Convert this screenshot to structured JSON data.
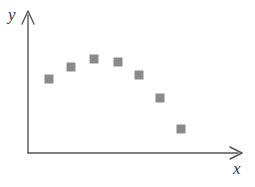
{
  "figure": {
    "background_color": "#ffffff",
    "axis_color": "#555555",
    "marker_color": "#8a8a8a"
  },
  "axes": {
    "x_label": "x",
    "y_label": "y",
    "x_axis_name": "x-axis",
    "y_axis_name": "y-axis",
    "origin": {
      "x": 28,
      "y": 153
    },
    "x_axis_tip": {
      "x": 241,
      "y": 153
    },
    "y_axis_tip": {
      "x": 28,
      "y": 11
    }
  },
  "chart_data": {
    "type": "scatter",
    "title": "",
    "xlabel": "x",
    "ylabel": "y",
    "grid": false,
    "legend": null,
    "marker": "square",
    "marker_color": "#8a8a8a",
    "marker_size_px": 9,
    "xlim": [
      0,
      10
    ],
    "ylim": [
      0,
      10
    ],
    "axis_ticks": false,
    "tick_labels": {
      "x": [],
      "y": []
    },
    "points": [
      {
        "x": 1,
        "y": 5.5,
        "px": 49,
        "py": 79
      },
      {
        "x": 2,
        "y": 6.6,
        "px": 71,
        "py": 67
      },
      {
        "x": 3,
        "y": 7.1,
        "px": 94,
        "py": 59
      },
      {
        "x": 4,
        "y": 6.9,
        "px": 118,
        "py": 62
      },
      {
        "x": 5,
        "y": 5.9,
        "px": 139,
        "py": 75
      },
      {
        "x": 6,
        "y": 4.3,
        "px": 160,
        "py": 98
      },
      {
        "x": 7,
        "y": 2.3,
        "px": 181,
        "py": 129
      }
    ]
  }
}
